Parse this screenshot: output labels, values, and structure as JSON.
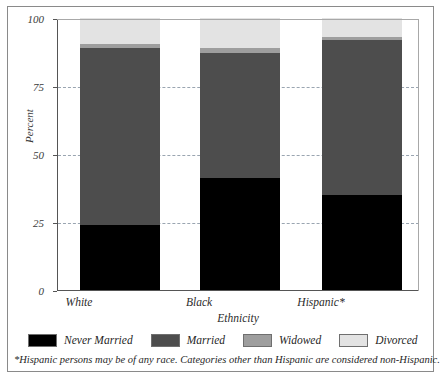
{
  "chart_data": {
    "type": "bar",
    "subtype": "stacked-bar-100",
    "title": "",
    "xlabel": "Ethnicity",
    "ylabel": "Percent",
    "categories": [
      "White",
      "Black",
      "Hispanic*"
    ],
    "series": [
      {
        "name": "Never Married",
        "color": "#000000",
        "values": [
          24,
          41,
          35
        ]
      },
      {
        "name": "Married",
        "color": "#4d4d4d",
        "values": [
          65,
          46,
          57
        ]
      },
      {
        "name": "Widowed",
        "color": "#9e9e9e",
        "values": [
          1.5,
          2,
          1
        ]
      },
      {
        "name": "Divorced",
        "color": "#e3e3e3",
        "values": [
          9.5,
          11,
          7
        ]
      }
    ],
    "ylim": [
      0,
      100
    ],
    "yticks": [
      0,
      25,
      50,
      75,
      100
    ],
    "ytick_labels": [
      "0",
      "25",
      "50",
      "75",
      "100"
    ],
    "grid": true,
    "grid_style": "dashed",
    "legend_position": "bottom"
  },
  "axes": {
    "y_label": "Percent",
    "x_label": "Ethnicity",
    "y_ticks": [
      {
        "value": 100,
        "label": "100"
      },
      {
        "value": 75,
        "label": "75"
      },
      {
        "value": 50,
        "label": "50"
      },
      {
        "value": 25,
        "label": "25"
      },
      {
        "value": 0,
        "label": "0"
      }
    ],
    "x_ticks": [
      {
        "label": "White"
      },
      {
        "label": "Black"
      },
      {
        "label": "Hispanic*"
      }
    ]
  },
  "legend": {
    "items": [
      {
        "label": "Never Married",
        "color": "#000000"
      },
      {
        "label": "Married",
        "color": "#4d4d4d"
      },
      {
        "label": "Widowed",
        "color": "#9e9e9e"
      },
      {
        "label": "Divorced",
        "color": "#e3e3e3"
      }
    ]
  },
  "footnote": {
    "text": "*Hispanic persons may be of any race. Categories other than Hispanic are considered non-Hispanic."
  }
}
